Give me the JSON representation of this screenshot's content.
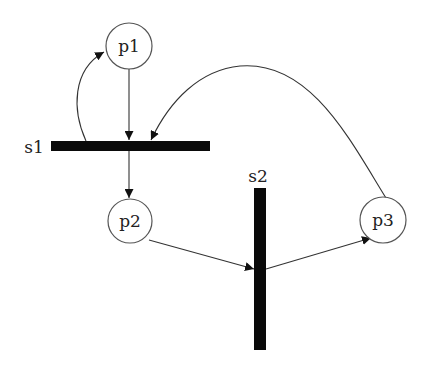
{
  "diagram": {
    "type": "petri-net",
    "places": [
      {
        "id": "p1",
        "label": "p1"
      },
      {
        "id": "p2",
        "label": "p2"
      },
      {
        "id": "p3",
        "label": "p3"
      }
    ],
    "transitions": [
      {
        "id": "s1",
        "label": "s1",
        "orientation": "horizontal"
      },
      {
        "id": "s2",
        "label": "s2",
        "orientation": "vertical"
      }
    ],
    "arcs": [
      {
        "from": "p1",
        "to": "s1"
      },
      {
        "from": "s1",
        "to": "p1"
      },
      {
        "from": "s1",
        "to": "p2"
      },
      {
        "from": "p2",
        "to": "s2"
      },
      {
        "from": "s2",
        "to": "p3"
      },
      {
        "from": "p3",
        "to": "s1"
      }
    ],
    "colors": {
      "bar": "#0a0a0a",
      "stroke": "#333333",
      "background": "#ffffff"
    }
  }
}
